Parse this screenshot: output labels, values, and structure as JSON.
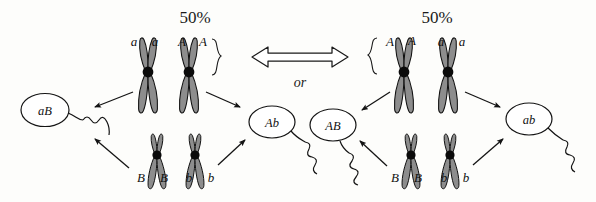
{
  "figure": {
    "title_left_percent": "50%",
    "title_right_percent": "50%",
    "connector_label": "or",
    "connector_icon": "double-headed-block-arrow"
  },
  "panels": [
    {
      "id": "left",
      "percent": "50%",
      "brace_side": "right",
      "brace_glyph": "}",
      "chromosome_pairs": {
        "top": [
          {
            "left_allele": "a",
            "right_allele": "a",
            "size": "large"
          },
          {
            "left_allele": "A",
            "right_allele": "A",
            "size": "large"
          }
        ],
        "bottom": [
          {
            "left_allele": "B",
            "right_allele": "B",
            "size": "small"
          },
          {
            "left_allele": "b",
            "right_allele": "b",
            "size": "small"
          }
        ]
      },
      "gametes": [
        {
          "label": "aB",
          "position": "left"
        },
        {
          "label": "Ab",
          "position": "right"
        }
      ]
    },
    {
      "id": "right",
      "percent": "50%",
      "brace_side": "left",
      "brace_glyph": "{",
      "chromosome_pairs": {
        "top": [
          {
            "left_allele": "A",
            "right_allele": "A",
            "size": "large"
          },
          {
            "left_allele": "a",
            "right_allele": "a",
            "size": "large"
          }
        ],
        "bottom": [
          {
            "left_allele": "B",
            "right_allele": "B",
            "size": "small"
          },
          {
            "left_allele": "b",
            "right_allele": "b",
            "size": "small"
          }
        ]
      },
      "gametes": [
        {
          "label": "AB",
          "position": "left"
        },
        {
          "label": "ab",
          "position": "right"
        }
      ]
    }
  ],
  "colors": {
    "background": "#fdfdfb",
    "ink": "#1a1a1a",
    "chromosome_arm_fill": "#8a8a8a",
    "chromosome_arm_stroke": "#111111",
    "centromere": "#0b0b0b",
    "gamete_fill": "#ffffff"
  }
}
